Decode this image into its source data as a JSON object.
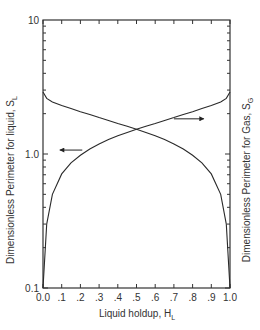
{
  "chart_data": {
    "type": "line",
    "title": "",
    "xlabel": "Liquid holdup, H",
    "xlabel_sub": "L",
    "ylabel_left": "Dimensionless Perimeter for liquid, S",
    "ylabel_left_sub": "L",
    "ylabel_right": "Dimensionless Perimeter for Gas, S",
    "ylabel_right_sub": "G",
    "xlim": [
      0.0,
      1.0
    ],
    "ylim": [
      0.1,
      10
    ],
    "yscale": "log",
    "grid": false,
    "x_ticks": [
      "0.0",
      ".1",
      ".2",
      ".3",
      ".4",
      ".5",
      ".6",
      ".7",
      ".8",
      ".9",
      "1.0"
    ],
    "y_ticks_left": [
      "10",
      "1.0",
      "0.1"
    ],
    "x": [
      0.0,
      0.02,
      0.05,
      0.1,
      0.15,
      0.2,
      0.25,
      0.3,
      0.35,
      0.4,
      0.45,
      0.5,
      0.55,
      0.6,
      0.65,
      0.7,
      0.75,
      0.8,
      0.85,
      0.9,
      0.95,
      0.98,
      1.0
    ],
    "series": [
      {
        "name": "S_L (liquid)",
        "axis": "left",
        "values": [
          2.9,
          2.6,
          2.45,
          2.3,
          2.18,
          2.07,
          1.97,
          1.87,
          1.78,
          1.69,
          1.61,
          1.53,
          1.45,
          1.37,
          1.28,
          1.19,
          1.09,
          0.98,
          0.86,
          0.71,
          0.5,
          0.3,
          0.1
        ]
      },
      {
        "name": "S_G (gas)",
        "axis": "right",
        "values": [
          0.1,
          0.3,
          0.5,
          0.71,
          0.86,
          0.98,
          1.09,
          1.19,
          1.28,
          1.37,
          1.45,
          1.53,
          1.61,
          1.69,
          1.78,
          1.87,
          1.97,
          2.07,
          2.18,
          2.3,
          2.45,
          2.6,
          2.9
        ]
      }
    ],
    "annotations": [
      {
        "type": "arrow",
        "direction": "left",
        "from": [
          0.21,
          1.07
        ],
        "to": [
          0.09,
          1.07
        ],
        "meaning": "liquid curve reads on left axis"
      },
      {
        "type": "arrow",
        "direction": "right",
        "from": [
          0.7,
          1.83
        ],
        "to": [
          0.86,
          1.83
        ],
        "meaning": "gas curve reads on right axis"
      }
    ],
    "colors": {
      "line": "#2a2a2a",
      "axis": "#333333",
      "background": "#ffffff"
    }
  }
}
